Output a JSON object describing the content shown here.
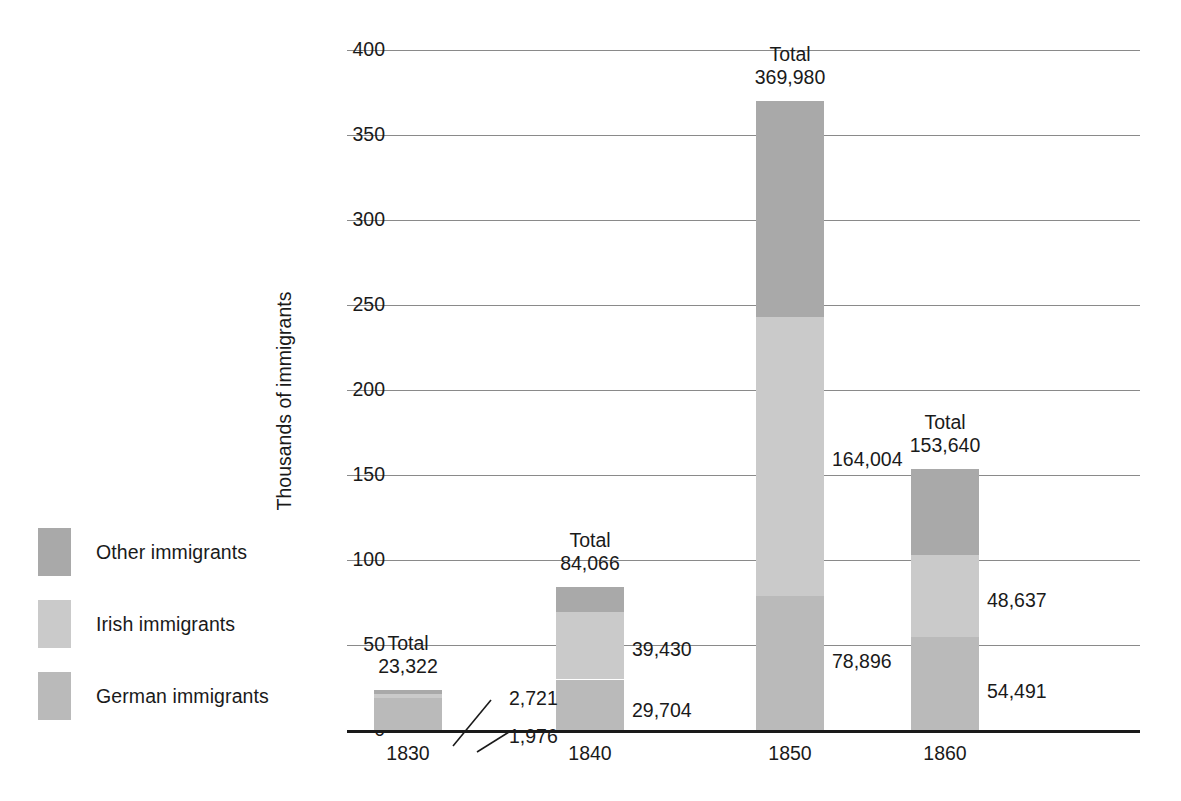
{
  "chart_data": {
    "type": "bar",
    "subtype": "stacked-bar",
    "title": "",
    "xlabel": "",
    "ylabel": "Thousands of immigrants",
    "categories": [
      "1830",
      "1840",
      "1850",
      "1860"
    ],
    "ylim": [
      0,
      400
    ],
    "yticks": [
      0,
      50,
      100,
      150,
      200,
      250,
      300,
      350,
      400
    ],
    "ytick_labels": [
      "0",
      "50",
      "100",
      "150",
      "200",
      "250",
      "300",
      "350",
      "400"
    ],
    "grid": true,
    "legend_position": "left",
    "units": "immigrants (axis shown in thousands)",
    "series": [
      {
        "name": "German immigrants",
        "color": "#bababa",
        "values": [
          18625,
          29704,
          78896,
          54491
        ],
        "labels": [
          "",
          "29,704",
          "78,896",
          "54,491"
        ]
      },
      {
        "name": "Irish immigrants",
        "color": "#cacaca",
        "values": [
          2721,
          39430,
          164004,
          48637
        ],
        "labels": [
          "2,721",
          "39,430",
          "164,004",
          "48,637"
        ]
      },
      {
        "name": "Other immigrants",
        "color": "#a9a9a9",
        "values": [
          1976,
          14932,
          127080,
          50512
        ],
        "labels": [
          "1,976",
          "",
          "",
          ""
        ]
      }
    ],
    "totals": [
      23322,
      84066,
      369980,
      153640
    ],
    "total_labels": [
      "23,322",
      "84,066",
      "369,980",
      "153,640"
    ],
    "total_word": "Total"
  },
  "legend": {
    "items": [
      {
        "label": "Other immigrants",
        "color": "#a9a9a9"
      },
      {
        "label": "Irish immigrants",
        "color": "#cacaca"
      },
      {
        "label": "German immigrants",
        "color": "#bababa"
      }
    ]
  },
  "axis": {
    "y_title": "Thousands of immigrants",
    "y_ticks": [
      "400",
      "350",
      "300",
      "250",
      "200",
      "150",
      "100",
      "50",
      "0"
    ],
    "x_ticks": [
      "1830",
      "1840",
      "1850",
      "1860"
    ]
  },
  "annotations": {
    "total_word": "Total",
    "c1830": {
      "total": "23,322",
      "irish": "2,721",
      "other": "1,976"
    },
    "c1840": {
      "total": "84,066",
      "irish": "39,430",
      "german": "29,704"
    },
    "c1850": {
      "total": "369,980",
      "irish": "164,004",
      "german": "78,896"
    },
    "c1860": {
      "total": "153,640",
      "irish": "48,637",
      "german": "54,491"
    }
  },
  "colors": {
    "other": "#a9a9a9",
    "irish": "#cacaca",
    "german": "#bababa",
    "grid": "#8a8a8a",
    "axis": "#1a1a1a",
    "background": "#ffffff"
  }
}
